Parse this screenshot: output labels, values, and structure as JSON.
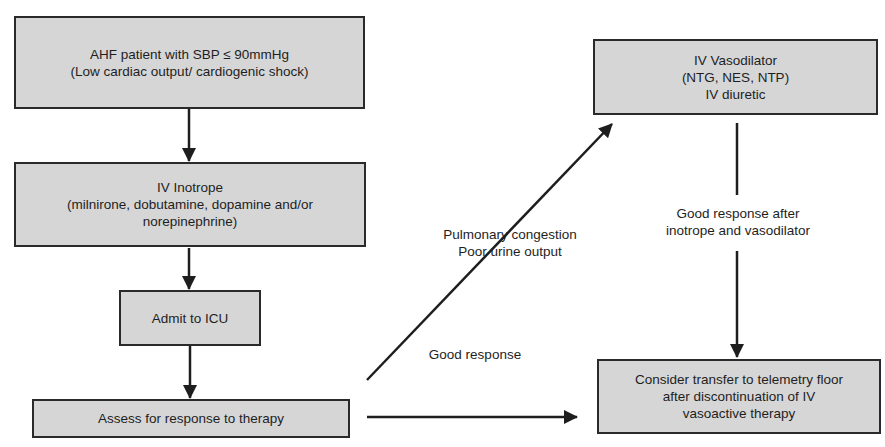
{
  "nodes": [
    {
      "id": "start",
      "lines": [
        "AHF patient with SBP ≤ 90mmHg",
        "(Low cardiac output/ cardiogenic shock)"
      ]
    },
    {
      "id": "inotrope",
      "lines": [
        "IV Inotrope",
        "(milnirone, dobutamine, dopamine and/or",
        "norepinephrine)"
      ]
    },
    {
      "id": "icu",
      "lines": [
        "Admit to ICU"
      ]
    },
    {
      "id": "assess",
      "lines": [
        "Assess for response to therapy"
      ]
    },
    {
      "id": "vasodilator",
      "lines": [
        "IV Vasodilator",
        "(NTG, NES, NTP)",
        "IV diuretic"
      ]
    },
    {
      "id": "transfer",
      "lines": [
        "Consider transfer to telemetry floor",
        "after discontinuation of IV",
        "vasoactive therapy"
      ]
    }
  ],
  "edge_labels": {
    "poor": [
      "Pulmonary congestion",
      "Poor urine output"
    ],
    "good": [
      "Good response"
    ],
    "good_after": [
      "Good response after",
      "inotrope and vasodilator"
    ]
  },
  "edges": [
    {
      "from": "start",
      "to": "inotrope"
    },
    {
      "from": "inotrope",
      "to": "icu"
    },
    {
      "from": "icu",
      "to": "assess"
    },
    {
      "from": "assess",
      "to": "vasodilator",
      "label": "poor"
    },
    {
      "from": "assess",
      "to": "transfer",
      "label": "good"
    },
    {
      "from": "vasodilator",
      "to": "transfer",
      "label": "good_after"
    }
  ],
  "colors": {
    "box_fill": "#d6d6d6",
    "stroke": "#2a2a2a",
    "text": "#1e1e1e"
  }
}
